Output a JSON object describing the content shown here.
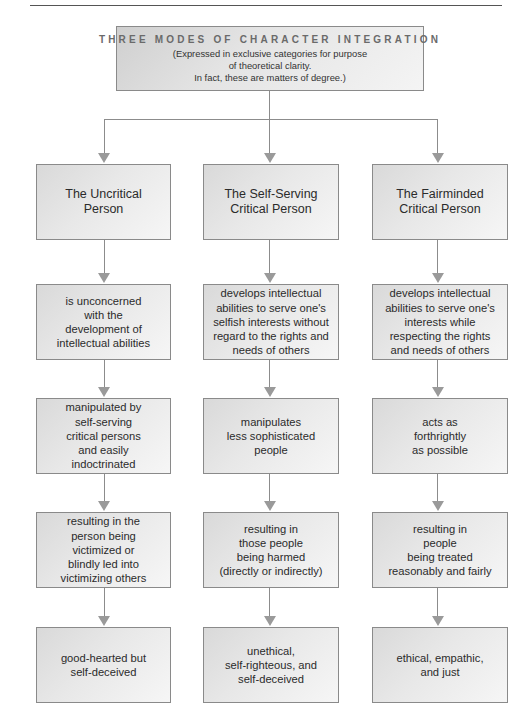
{
  "diagram": {
    "title": "THREE MODES OF CHARACTER INTEGRATION",
    "subtitle": "(Expressed in exclusive categories for purpose\nof theoretical clarity.\nIn fact, these are matters of degree.)",
    "columns": [
      {
        "heading": "The Uncritical\nPerson",
        "steps": [
          "is unconcerned\nwith the\ndevelopment of\nintellectual abilities",
          "manipulated by\nself-serving\ncritical persons\nand easily\nindoctrinated",
          "resulting in the\nperson being\nvictimized or\nblindly led into\nvictimizing others",
          "good-hearted but\nself-deceived"
        ]
      },
      {
        "heading": "The Self-Serving\nCritical Person",
        "steps": [
          "develops intellectual\nabilities to serve one's\nselfish interests without\nregard to the rights and\nneeds of others",
          "manipulates\nless sophisticated\npeople",
          "resulting in\nthose people\nbeing harmed\n(directly or indirectly)",
          "unethical,\nself-righteous, and\nself-deceived"
        ]
      },
      {
        "heading": "The Fairminded\nCritical Person",
        "steps": [
          "develops intellectual\nabilities to serve one's\ninterests while\nrespecting the rights\nand needs of others",
          "acts as\nforthrightly\nas possible",
          "resulting in\npeople\nbeing treated\nreasonably and fairly",
          "ethical, empathic,\nand just"
        ]
      }
    ],
    "colors": {
      "box_border": "#8a8a8a",
      "connector": "#8c8c8c",
      "title_text": "#6a6a6a",
      "body_text": "#2b2b2b"
    }
  }
}
